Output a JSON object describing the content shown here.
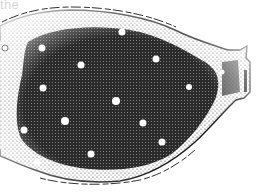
{
  "caption": {
    "fragment": "the"
  },
  "illustration": {
    "subject": "stippled organism body with white spots",
    "style": "black-and-white stipple drawing",
    "colors": {
      "ink": "#1a1a1a",
      "paper": "#ffffff",
      "mid_stipple": "#3a3a3a"
    },
    "spots": [
      {
        "x": 5,
        "y": 48,
        "r": 3
      },
      {
        "x": 42,
        "y": 48,
        "r": 3.5
      },
      {
        "x": 122,
        "y": 32,
        "r": 3.5
      },
      {
        "x": 81,
        "y": 65,
        "r": 3.5
      },
      {
        "x": 156,
        "y": 59,
        "r": 3.5
      },
      {
        "x": 43,
        "y": 88,
        "r": 3.5
      },
      {
        "x": 116,
        "y": 101,
        "r": 4
      },
      {
        "x": 189,
        "y": 87,
        "r": 3
      },
      {
        "x": 65,
        "y": 121,
        "r": 4
      },
      {
        "x": 143,
        "y": 123,
        "r": 3.5
      },
      {
        "x": 24,
        "y": 130,
        "r": 3.5
      },
      {
        "x": 162,
        "y": 142,
        "r": 3.5
      },
      {
        "x": 91,
        "y": 154,
        "r": 3.5
      },
      {
        "x": 37,
        "y": 162,
        "r": 3.5
      },
      {
        "x": 222,
        "y": 72,
        "r": 2.5
      }
    ]
  }
}
